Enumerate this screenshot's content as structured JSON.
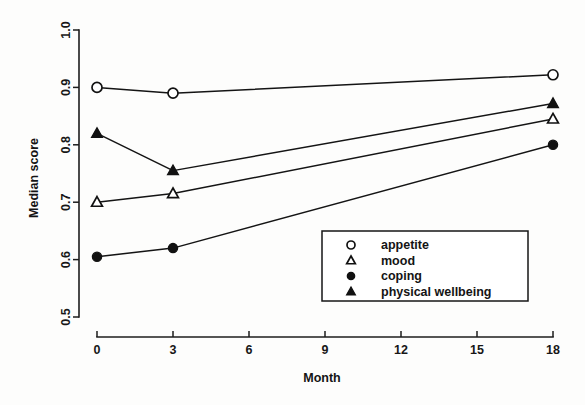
{
  "chart_data": {
    "type": "line",
    "title": "",
    "xlabel": "Month",
    "ylabel": "Median score",
    "x": [
      0,
      3,
      18
    ],
    "xlim": [
      0,
      18
    ],
    "ylim": [
      0.5,
      1.0
    ],
    "xticks": [
      0,
      3,
      6,
      9,
      12,
      15,
      18
    ],
    "xtick_labels": [
      "0",
      "3",
      "6",
      "9",
      "12",
      "15",
      "18"
    ],
    "yticks": [
      0.5,
      0.6,
      0.7,
      0.8,
      0.9,
      1.0
    ],
    "ytick_labels": [
      "0.5",
      "0.6",
      "0.7",
      "0.8",
      "0.9",
      "1.0"
    ],
    "grid": false,
    "legend_position": "bottom-right",
    "series": [
      {
        "name": "appetite",
        "marker": "open-circle",
        "values": [
          0.9,
          0.89,
          0.922
        ]
      },
      {
        "name": "mood",
        "marker": "open-triangle",
        "values": [
          0.7,
          0.715,
          0.845
        ]
      },
      {
        "name": "coping",
        "marker": "filled-circle",
        "values": [
          0.605,
          0.62,
          0.8
        ]
      },
      {
        "name": "physical wellbeing",
        "marker": "filled-triangle",
        "values": [
          0.82,
          0.755,
          0.872
        ]
      }
    ]
  },
  "legend": {
    "entries": [
      {
        "label": "appetite",
        "marker": "open-circle"
      },
      {
        "label": "mood",
        "marker": "open-triangle"
      },
      {
        "label": "coping",
        "marker": "filled-circle"
      },
      {
        "label": "physical wellbeing",
        "marker": "filled-triangle"
      }
    ]
  }
}
